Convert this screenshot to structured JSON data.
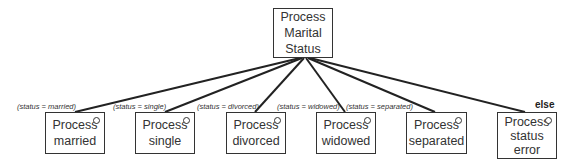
{
  "root": {
    "lines": [
      "Process",
      "Marital",
      "Status"
    ]
  },
  "children": [
    {
      "lines": [
        "Process",
        "married"
      ],
      "condition": "(status = married)"
    },
    {
      "lines": [
        "Process",
        "single"
      ],
      "condition": "(status = single)"
    },
    {
      "lines": [
        "Process",
        "divorced"
      ],
      "condition": "(status = divorced)"
    },
    {
      "lines": [
        "Process",
        "widowed"
      ],
      "condition": "(status = widowed)"
    },
    {
      "lines": [
        "Process",
        "separated"
      ],
      "condition": "(status = separated)"
    },
    {
      "lines": [
        "Process",
        "status",
        "error"
      ],
      "condition": "else"
    }
  ],
  "colors": {
    "stroke": "#333333",
    "background": "#ffffff"
  }
}
